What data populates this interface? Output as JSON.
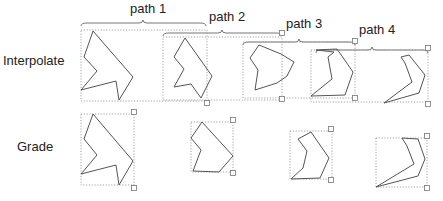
{
  "rows": {
    "interpolate": {
      "label": "Interpolate",
      "x": 3,
      "y": 53
    },
    "grade": {
      "label": "Grade",
      "x": 17,
      "y": 139
    }
  },
  "path_labels": [
    {
      "text": "path 1",
      "x": 130,
      "y": 1
    },
    {
      "text": "path 2",
      "x": 209,
      "y": 9
    },
    {
      "text": "path 3",
      "x": 286,
      "y": 16
    },
    {
      "text": "path 4",
      "x": 359,
      "y": 22
    }
  ],
  "colors": {
    "shape_stroke": "#555555",
    "bbox_stroke": "#9a9a9a",
    "brace_stroke": "#666666",
    "text": "#222222"
  },
  "braces": [
    {
      "x1": 81,
      "x2": 206,
      "y": 23,
      "mid": 143
    },
    {
      "x1": 163,
      "x2": 282,
      "y": 33,
      "mid": 222
    },
    {
      "x1": 243,
      "x2": 355,
      "y": 42,
      "mid": 299
    },
    {
      "x1": 316,
      "x2": 428,
      "y": 50,
      "mid": 372
    }
  ],
  "interpolate_boxes": [
    {
      "x": 81,
      "y": 30,
      "w": 126,
      "h": 71
    },
    {
      "x": 163,
      "y": 37,
      "w": 119,
      "h": 63
    },
    {
      "x": 243,
      "y": 42,
      "w": 112,
      "h": 56
    },
    {
      "x": 311,
      "y": 50,
      "w": 117,
      "h": 52
    }
  ],
  "interpolate_shapes": [
    {
      "points": "93,31 84,57 97,71 81,90 116,81 119,100 133,77"
    },
    {
      "points": "185,38 174,57 184,69 174,87 191,84 201,98 212,76"
    },
    {
      "points": "259,45 250,58 258,70 255,90 277,83 287,76 294,62 281,54"
    },
    {
      "points": "316,50 337,49 353,72 345,95 311,96 332,79 328,57 334,52"
    },
    {
      "points": "401,57 409,55 425,75 419,93 384,103 412,82 405,63"
    }
  ],
  "interpolate_handles": [
    {
      "x": 207,
      "y": 103
    },
    {
      "x": 282,
      "y": 33
    },
    {
      "x": 282,
      "y": 99
    },
    {
      "x": 355,
      "y": 41
    },
    {
      "x": 355,
      "y": 98
    },
    {
      "x": 428,
      "y": 48
    },
    {
      "x": 428,
      "y": 104
    }
  ],
  "grade_boxes": [
    {
      "x": 81,
      "y": 114,
      "w": 53,
      "h": 71
    },
    {
      "x": 191,
      "y": 122,
      "w": 42,
      "h": 50
    },
    {
      "x": 290,
      "y": 131,
      "w": 42,
      "h": 48
    },
    {
      "x": 376,
      "y": 138,
      "w": 51,
      "h": 49
    }
  ],
  "grade_shapes": [
    {
      "points": "93,114 84,139 97,155 81,174 116,165 119,185 133,161"
    },
    {
      "points": "202,122 191,138 201,150 193,171 219,172 233,156"
    },
    {
      "points": "311,132 298,139 307,151 303,168 291,179 320,178 329,158"
    },
    {
      "points": "402,138 418,139 425,159 418,176 376,187 414,164 407,146"
    }
  ],
  "grade_handles": [
    {
      "x": 134,
      "y": 112
    },
    {
      "x": 134,
      "y": 188
    },
    {
      "x": 233,
      "y": 120
    },
    {
      "x": 233,
      "y": 173
    },
    {
      "x": 331,
      "y": 129
    },
    {
      "x": 331,
      "y": 180
    },
    {
      "x": 427,
      "y": 136
    },
    {
      "x": 427,
      "y": 188
    }
  ]
}
